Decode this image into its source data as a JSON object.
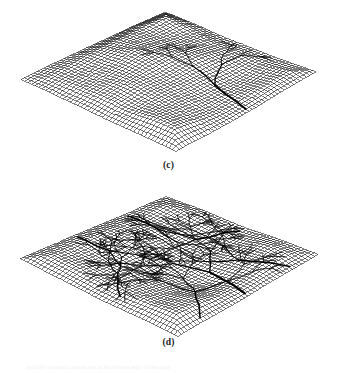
{
  "figure": {
    "kind": "scientific-figure",
    "background_color": "#ffffff",
    "ink_color": "#000000",
    "panels": [
      {
        "id": "c",
        "label": "(c)",
        "description": "Three-dimensional wireframe mesh of a simulated eroded landscape surface viewed in oblique projection, with a dendritic drainage/channel network drawn as heavy black lines over the mesh.",
        "projection": {
          "top_vertex": [
            165,
            12
          ],
          "right_vertex": [
            316,
            70
          ],
          "bottom_vertex": [
            176,
            152
          ],
          "left_vertex": [
            21,
            76
          ]
        },
        "mesh": {
          "rows": 44,
          "cols": 44,
          "line_color": "#000000",
          "line_width": 0.5,
          "cell_size_px": 4
        },
        "terrain": {
          "relief_amplitude_px": 18,
          "roughness": 0.55,
          "seed": 1207,
          "basin_center_u": 0.5,
          "basin_center_v": 0.72
        },
        "network": {
          "line_color": "#000000",
          "trunk_width": 1.9,
          "branch_width": 1.15,
          "twig_width": 0.7,
          "outlet_u": 0.52,
          "outlet_v": 1.0,
          "branch_levels": 5,
          "coverage": "lower-central half of the domain",
          "density": "moderate",
          "seed": 41
        }
      },
      {
        "id": "d",
        "label": "(d)",
        "description": "Three-dimensional wireframe mesh of a more maturely dissected landscape surface in the same oblique projection, with a denser drainage network of heavy black channel lines covering nearly the whole domain.",
        "projection": {
          "top_vertex": [
            166,
            195
          ],
          "right_vertex": [
            318,
            252
          ],
          "bottom_vertex": [
            178,
            337
          ],
          "left_vertex": [
            20,
            258
          ]
        },
        "mesh": {
          "rows": 44,
          "cols": 44,
          "line_color": "#000000",
          "line_width": 0.5,
          "cell_size_px": 4
        },
        "terrain": {
          "relief_amplitude_px": 15,
          "roughness": 0.62,
          "seed": 3391,
          "basin_center_u": 0.5,
          "basin_center_v": 0.6
        },
        "network": {
          "line_color": "#000000",
          "trunk_width": 2.0,
          "branch_width": 1.25,
          "twig_width": 0.75,
          "outlet_u": 0.5,
          "outlet_v": 1.0,
          "branch_levels": 6,
          "coverage": "entire domain",
          "density": "high",
          "seed": 88
        }
      }
    ],
    "caption_remnant": "partially cropped caption text at the bottom edge of the page"
  }
}
